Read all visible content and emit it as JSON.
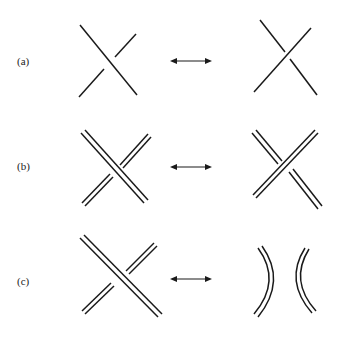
{
  "figure": {
    "colors": {
      "ink": "#1a1a1a",
      "background": "#ffffff"
    },
    "rows": [
      {
        "label": "(a)",
        "left": "single-strand crossing (NW-SE over)",
        "relation": "double-arrow",
        "right": "single-strand crossing (SW-NE over)"
      },
      {
        "label": "(b)",
        "left": "doubled-strand crossing (NW-SE over)",
        "relation": "double-arrow",
        "right": "doubled-strand crossing (SW-NE over)"
      },
      {
        "label": "(c)",
        "left": "doubled-strand crossing (NW-SE over)",
        "relation": "double-arrow",
        "right": "two doubled arcs ) ( (smoothing)"
      }
    ]
  }
}
